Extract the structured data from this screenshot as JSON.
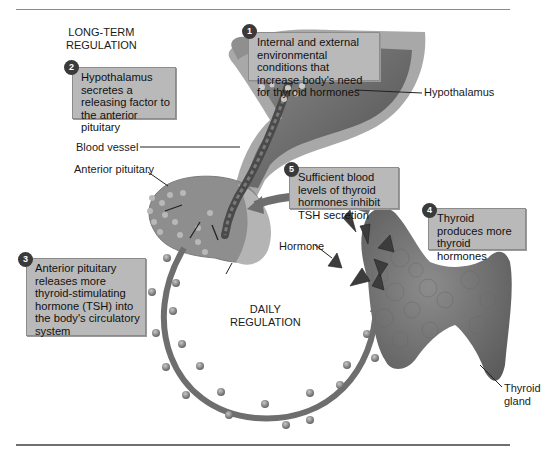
{
  "section_labels": {
    "long_term": [
      "LONG-TERM",
      "REGULATION"
    ],
    "daily": [
      "DAILY",
      "REGULATION"
    ]
  },
  "steps": [
    {
      "number": "1",
      "text": "Internal and external environmental conditions that increase body's need for thyroid hormones"
    },
    {
      "number": "2",
      "text": "Hypothalamus secretes a releasing factor to the anterior pituitary"
    },
    {
      "number": "3",
      "text": "Anterior pituitary releases more thyroid-stimulating hormone (TSH) into the body's circulatory system"
    },
    {
      "number": "4",
      "text": "Thyroid produces more thyroid hormones"
    },
    {
      "number": "5",
      "text": "Sufficient blood levels of thyroid hormones inhibit TSH secretion"
    }
  ],
  "callouts": {
    "hypothalamus": "Hypothalamus",
    "blood_vessel": "Blood vessel",
    "anterior_pituitary": "Anterior pituitary",
    "hormone": "Hormone",
    "thyroid_gland": [
      "Thyroid",
      "gland"
    ]
  },
  "colors": {
    "box_fill": "#b9b9b9",
    "badge": "#3a3a3a",
    "tissue_dark": "#5e5e5e",
    "tissue_light": "#9a9a9a",
    "arrow": "#6e6e6e"
  }
}
